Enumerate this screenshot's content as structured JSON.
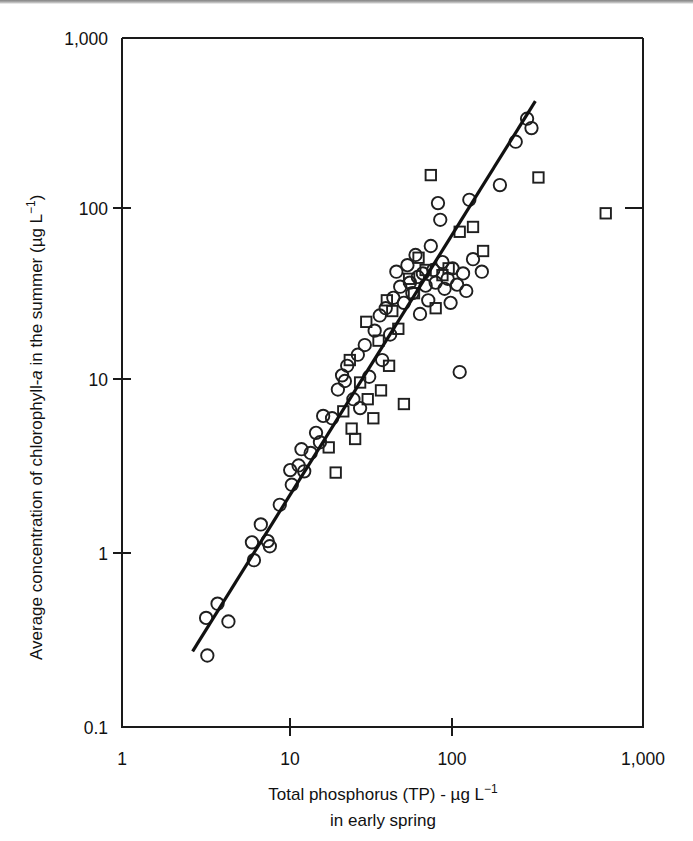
{
  "figure": {
    "background_color": "#ffffff",
    "ink_color": "#1a1a1a"
  },
  "chart_data": {
    "type": "scatter",
    "title": "",
    "subtitle": "",
    "xlabel": "Total phosphorus (TP) - µg L−1 in early spring",
    "ylabel": "Average concentration of chlorophyll-a in the summer (µg L−1)",
    "xlabel_line1_parts": {
      "main": "Total phosphorus (TP) - µg L",
      "exponent": "−1"
    },
    "xlabel_line2": "in early spring",
    "ylabel_parts": {
      "pre_italic": "Average concentration of chlorophyll-",
      "italic": "a",
      "post_italic": " in the summer (µg L",
      "exponent": "−1",
      "tail": ")"
    },
    "xscale": "log",
    "yscale": "log",
    "xlim": [
      1,
      1000
    ],
    "ylim": [
      0.1,
      1000
    ],
    "xticks": [
      1,
      10,
      100,
      1000
    ],
    "xtick_labels": [
      "1",
      "10",
      "100",
      "1,000"
    ],
    "yticks": [
      0.1,
      1,
      10,
      100,
      1000
    ],
    "ytick_labels": [
      "0.1",
      "1",
      "10",
      "100",
      "1,000"
    ],
    "grid": false,
    "legend_position": "none",
    "legend_entries": [
      {
        "name": "circle-series",
        "marker": "open-circle"
      },
      {
        "name": "square-series",
        "marker": "open-square"
      }
    ],
    "trendline": {
      "type": "log-log-linear",
      "x_start": 2.55,
      "y_start": 0.275,
      "x_end": 240,
      "y_end": 430
    },
    "series": [
      {
        "name": "circle-series",
        "marker": "open-circle",
        "points": [
          [
            3.1,
            0.26
          ],
          [
            3.05,
            0.43
          ],
          [
            3.55,
            0.52
          ],
          [
            4.1,
            0.41
          ],
          [
            5.6,
            1.18
          ],
          [
            5.75,
            0.93
          ],
          [
            6.3,
            1.5
          ],
          [
            6.9,
            1.2
          ],
          [
            7.1,
            1.12
          ],
          [
            8.1,
            1.95
          ],
          [
            9.3,
            3.1
          ],
          [
            9.5,
            2.55
          ],
          [
            10.4,
            3.3
          ],
          [
            11.2,
            3.05
          ],
          [
            10.8,
            4.1
          ],
          [
            12.2,
            3.9
          ],
          [
            13.1,
            5.1
          ],
          [
            14.4,
            6.4
          ],
          [
            13.8,
            4.5
          ],
          [
            16.2,
            6.2
          ],
          [
            17.5,
            9.1
          ],
          [
            18.5,
            11.0
          ],
          [
            19.2,
            10.2
          ],
          [
            19.8,
            12.5
          ],
          [
            21.5,
            8.0
          ],
          [
            22.8,
            14.5
          ],
          [
            23.5,
            7.1
          ],
          [
            25.0,
            16.5
          ],
          [
            26.5,
            10.8
          ],
          [
            28.5,
            20.0
          ],
          [
            30.5,
            24.5
          ],
          [
            31.5,
            13.5
          ],
          [
            33.0,
            27.0
          ],
          [
            35.0,
            19.0
          ],
          [
            36.5,
            31.0
          ],
          [
            38.0,
            44.0
          ],
          [
            40.0,
            36.0
          ],
          [
            42.0,
            29.0
          ],
          [
            44.0,
            48.0
          ],
          [
            45.5,
            38.0
          ],
          [
            47.0,
            33.0
          ],
          [
            49.0,
            55.0
          ],
          [
            50.5,
            41.0
          ],
          [
            52.0,
            25.0
          ],
          [
            54.0,
            43.0
          ],
          [
            56.0,
            36.5
          ],
          [
            58.0,
            30.0
          ],
          [
            60.0,
            62.0
          ],
          [
            62.0,
            45.0
          ],
          [
            64.0,
            38.0
          ],
          [
            66.0,
            110.0
          ],
          [
            68.0,
            88.0
          ],
          [
            70.0,
            50.0
          ],
          [
            72.0,
            35.0
          ],
          [
            75.0,
            40.0
          ],
          [
            78.0,
            29.0
          ],
          [
            80.0,
            46.0
          ],
          [
            85.0,
            37.0
          ],
          [
            88.0,
            11.5
          ],
          [
            92.0,
            43.0
          ],
          [
            96.0,
            34.0
          ],
          [
            100.0,
            115.0
          ],
          [
            105.0,
            52.0
          ],
          [
            118.0,
            44.0
          ],
          [
            150.0,
            140.0
          ],
          [
            185.0,
            250.0
          ],
          [
            215.0,
            340.0
          ],
          [
            228.0,
            300.0
          ]
        ]
      },
      {
        "name": "square-series",
        "marker": "open-square",
        "points": [
          [
            15.5,
            4.2
          ],
          [
            17.0,
            3.0
          ],
          [
            18.8,
            6.8
          ],
          [
            20.5,
            13.5
          ],
          [
            21.0,
            5.4
          ],
          [
            22.0,
            4.7
          ],
          [
            23.5,
            10.0
          ],
          [
            25.5,
            22.5
          ],
          [
            26.0,
            8.0
          ],
          [
            28.0,
            6.2
          ],
          [
            30.0,
            17.5
          ],
          [
            31.0,
            9.0
          ],
          [
            33.5,
            30.0
          ],
          [
            34.5,
            12.5
          ],
          [
            36.0,
            26.0
          ],
          [
            39.0,
            20.5
          ],
          [
            42.0,
            7.5
          ],
          [
            45.0,
            40.0
          ],
          [
            48.0,
            33.0
          ],
          [
            51.0,
            53.0
          ],
          [
            56.0,
            45.0
          ],
          [
            60.0,
            160.0
          ],
          [
            64.0,
            27.0
          ],
          [
            70.0,
            42.0
          ],
          [
            76.0,
            46.0
          ],
          [
            88.0,
            75.0
          ],
          [
            105.0,
            80.0
          ],
          [
            120.0,
            58.0
          ],
          [
            250.0,
            155.0
          ],
          [
            610.0,
            96.0
          ]
        ]
      }
    ]
  },
  "axes": {
    "x_tick_texts": [
      "1",
      "10",
      "100",
      "1,000"
    ],
    "y_tick_texts": [
      "1,000",
      "100",
      "10",
      "1",
      "0.1"
    ]
  }
}
